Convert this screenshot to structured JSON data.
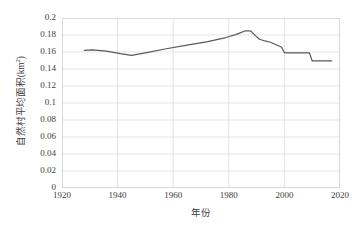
{
  "chart_data": {
    "type": "line",
    "title": "",
    "xlabel": "年份",
    "ylabel": "自然村平均面积(km",
    "ylabel_sup": "2",
    "ylabel_suffix": ")",
    "xlim": [
      1920,
      2020
    ],
    "ylim": [
      0,
      0.2
    ],
    "xticks": [
      1920,
      1940,
      1960,
      1980,
      2000,
      2020
    ],
    "xtick_labels": [
      "1920",
      "1940",
      "1960",
      "1980",
      "2000",
      "2020"
    ],
    "yticks": [
      0,
      0.02,
      0.04,
      0.06,
      0.08,
      0.1,
      0.12,
      0.14,
      0.16,
      0.18,
      0.2
    ],
    "ytick_labels": [
      "0",
      "0.02",
      "0.04",
      "0.06",
      "0.08",
      "0.1",
      "0.12",
      "0.14",
      "0.16",
      "0.18",
      "0.2"
    ],
    "grid": true,
    "grid_axes": "both",
    "grid_color": "#d9d9d9",
    "legend": false,
    "legend_position": "none",
    "series": [
      {
        "name": "自然村平均面积",
        "color": "#595959",
        "line_width": 1.2,
        "x": [
          1928,
          1931,
          1936,
          1941,
          1945,
          1950,
          1957,
          1965,
          1972,
          1979,
          1983,
          1986,
          1988,
          1989,
          1991,
          1993,
          1995,
          1997,
          1998,
          1999,
          2000,
          2004,
          2008,
          2009,
          2010,
          2011,
          2017
        ],
        "y": [
          0.162,
          0.1625,
          0.161,
          0.158,
          0.156,
          0.159,
          0.1635,
          0.168,
          0.172,
          0.177,
          0.181,
          0.185,
          0.1845,
          0.181,
          0.175,
          0.173,
          0.1715,
          0.1685,
          0.167,
          0.1655,
          0.159,
          0.159,
          0.159,
          0.159,
          0.1495,
          0.1495,
          0.1495
        ]
      }
    ]
  },
  "axis": {
    "frame_color": "#d0d0d0"
  }
}
